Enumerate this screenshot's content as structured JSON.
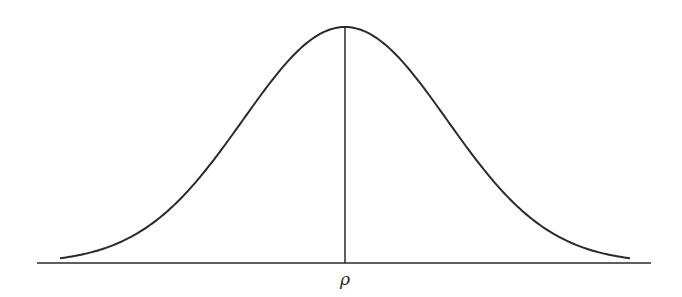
{
  "diagram": {
    "type": "gaussian-bell-curve",
    "center_label": "ρ",
    "stroke_color": "#2a2a2a",
    "background": "#ffffff"
  },
  "chart_data": {
    "type": "line",
    "title": "",
    "xlabel": "",
    "ylabel": "",
    "center_tick_label": "ρ",
    "curve": "normal distribution centered at ρ",
    "grid": false,
    "legend": null
  }
}
